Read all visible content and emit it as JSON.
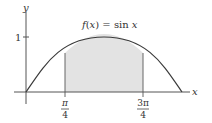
{
  "figure": {
    "function_label": "f(x) = sin x",
    "function_label_parts": {
      "f": "f",
      "open": "(",
      "x": "x",
      "close": ") = sin ",
      "x2": "x"
    },
    "x_axis_label": "x",
    "y_axis_label": "y",
    "y_tick_label": "1",
    "lower_bound": {
      "num": "π",
      "den": "4"
    },
    "upper_bound": {
      "num": "3π",
      "den": "4"
    },
    "shaded_region": "area under sin x from π/4 to 3π/4",
    "colors": {
      "curve": "#3a3a3a",
      "axes": "#555555",
      "shade": "#e3e3e3",
      "bound_lines": "#666666"
    }
  }
}
